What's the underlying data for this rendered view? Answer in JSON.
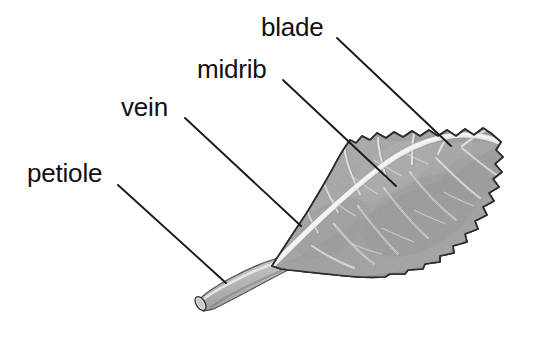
{
  "figure": {
    "background_color": "#ffffff",
    "width": 538,
    "height": 340
  },
  "labels": {
    "blade": "blade",
    "midrib": "midrib",
    "vein": "vein",
    "petiole": "petiole"
  },
  "colors": {
    "text": "#111111",
    "leader_line": "#1a1a1a",
    "outline": "#2b2b2b",
    "blade_light": "#c9c9c9",
    "blade_mid": "#b0b0b0",
    "blade_dark": "#9a9a9a",
    "vein_highlight": "#e8e8e8",
    "midrib_highlight": "#f0f0f0",
    "petiole_fill": "#c4c4c4",
    "petiole_tip": "#d8d8d8"
  },
  "leaders": [
    {
      "name": "blade",
      "x1": 337,
      "y1": 38,
      "x2": 451,
      "y2": 146
    },
    {
      "name": "midrib",
      "x1": 283,
      "y1": 80,
      "x2": 396,
      "y2": 186
    },
    {
      "name": "vein",
      "x1": 185,
      "y1": 118,
      "x2": 301,
      "y2": 226
    },
    {
      "name": "petiole",
      "x1": 118,
      "y1": 185,
      "x2": 226,
      "y2": 283
    }
  ],
  "anatomy": {
    "blade_description": "Broad ovate leaf blade with wavy crenate margin, shaded gray, apex pointing upper right",
    "midrib_description": "Pale central rib running from petiole base to leaf apex",
    "vein_description": "Lateral veins branching from the midrib toward the margin",
    "petiole_description": "Cylindrical leaf stalk extending to lower left with an elliptical cut end"
  }
}
